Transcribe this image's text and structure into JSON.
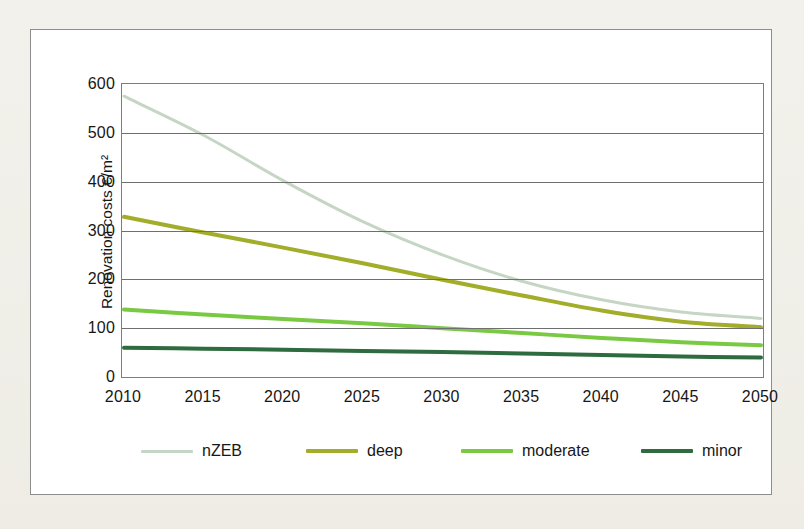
{
  "figure": {
    "background_color": "#f0efe9",
    "panel_color": "#ffffff",
    "border_color": "#8d8d8d"
  },
  "chart_data": {
    "type": "line",
    "title": "",
    "xlabel": "",
    "ylabel": "Renovation costs €/m²",
    "x": [
      2010,
      2015,
      2020,
      2025,
      2030,
      2035,
      2040,
      2045,
      2050
    ],
    "categories": [
      "2010",
      "2015",
      "2020",
      "2025",
      "2030",
      "2035",
      "2040",
      "2045",
      "2050"
    ],
    "xlim": [
      2010,
      2050
    ],
    "ylim": [
      0,
      600
    ],
    "yticks": [
      0,
      100,
      200,
      300,
      400,
      500,
      600
    ],
    "ytick_labels": [
      "0",
      "100",
      "200",
      "300",
      "400",
      "500",
      "600"
    ],
    "grid": true,
    "legend_position": "bottom",
    "series": [
      {
        "name": "nZEB",
        "color": "#c6d6c4",
        "width": 3,
        "values": [
          575,
          495,
          402,
          318,
          250,
          196,
          158,
          133,
          120
        ]
      },
      {
        "name": "deep",
        "color": "#a2ad2a",
        "width": 4,
        "values": [
          328,
          296,
          265,
          233,
          199,
          167,
          136,
          113,
          102
        ]
      },
      {
        "name": "moderate",
        "color": "#7ac943",
        "width": 4,
        "values": [
          138,
          128,
          119,
          110,
          100,
          90,
          80,
          71,
          65
        ]
      },
      {
        "name": "minor",
        "color": "#2e6b3e",
        "width": 4,
        "values": [
          60,
          58,
          56,
          53,
          51,
          48,
          45,
          42,
          40
        ]
      }
    ]
  }
}
